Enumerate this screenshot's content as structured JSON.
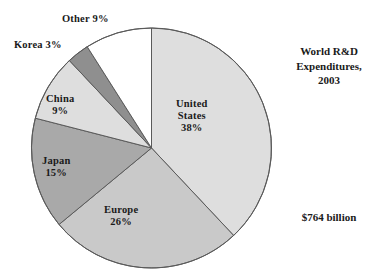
{
  "chart_data": {
    "type": "pie",
    "title": "World R&D Expenditures, 2003",
    "title_lines": [
      "World R&D",
      "Expenditures,",
      "2003"
    ],
    "total_label": "$764 billion",
    "units": "percent of total",
    "start_angle_deg": 0,
    "direction": "clockwise",
    "legend": "none",
    "grid": false,
    "categories": [
      "United States",
      "Europe",
      "Japan",
      "China",
      "Korea",
      "Other"
    ],
    "values": [
      38,
      26,
      15,
      9,
      3,
      9
    ],
    "slices": [
      {
        "name": "United States",
        "value": 38,
        "percent_label": "38%",
        "label_lines": [
          "United",
          "States",
          "38%"
        ],
        "color": "#dedede",
        "label_placement": "inside"
      },
      {
        "name": "Europe",
        "value": 26,
        "percent_label": "26%",
        "label_lines": [
          "Europe",
          "26%"
        ],
        "color": "#c9c9c9",
        "label_placement": "inside"
      },
      {
        "name": "Japan",
        "value": 15,
        "percent_label": "15%",
        "label_lines": [
          "Japan",
          "15%"
        ],
        "color": "#a9a9a9",
        "label_placement": "inside"
      },
      {
        "name": "China",
        "value": 9,
        "percent_label": "9%",
        "label_lines": [
          "China",
          "9%"
        ],
        "color": "#dedede",
        "label_placement": "inside"
      },
      {
        "name": "Korea",
        "value": 3,
        "percent_label": "3%",
        "label_lines": [
          "Korea 3%"
        ],
        "color": "#8f8f8f",
        "label_placement": "outside"
      },
      {
        "name": "Other",
        "value": 9,
        "percent_label": "9%",
        "label_lines": [
          "Other 9%"
        ],
        "color": "#ffffff",
        "label_placement": "outside"
      }
    ],
    "outline_color": "#5a5a5a",
    "background": "#ffffff"
  },
  "labels": {
    "united_states": {
      "l1": "United",
      "l2": "States",
      "l3": "38%"
    },
    "europe": {
      "l1": "Europe",
      "l2": "26%"
    },
    "japan": {
      "l1": "Japan",
      "l2": "15%"
    },
    "china": {
      "l1": "China",
      "l2": "9%"
    },
    "korea": {
      "l1": "Korea 3%"
    },
    "other": {
      "l1": "Other 9%"
    }
  },
  "title": {
    "l1": "World R&D",
    "l2": "Expenditures,",
    "l3": "2003"
  },
  "total": {
    "text": "$764 billion"
  }
}
